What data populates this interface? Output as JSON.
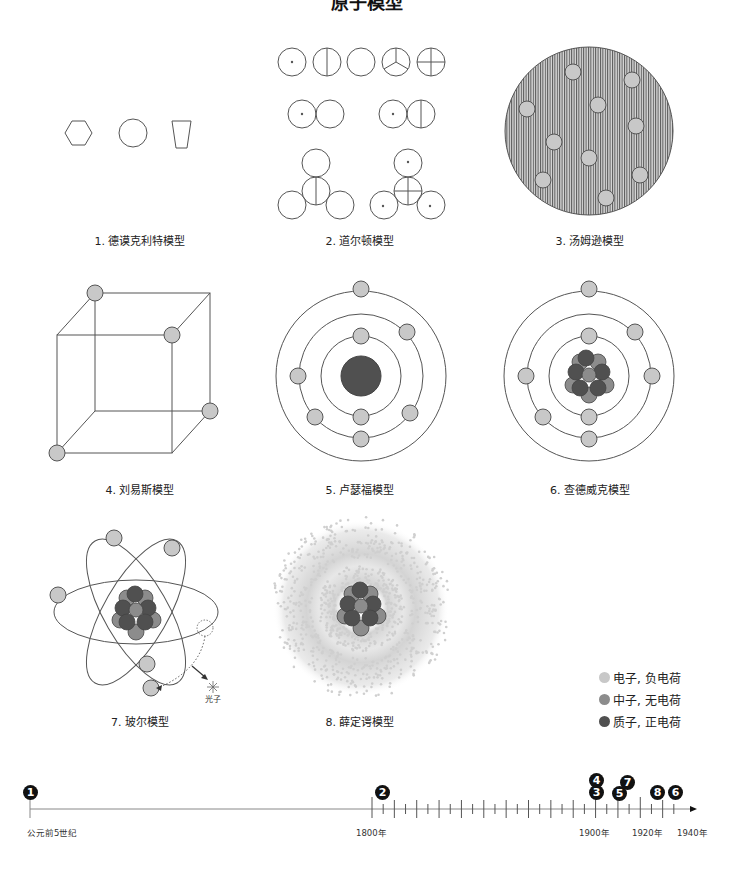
{
  "title": "原子模型",
  "colors": {
    "electron": "#c8c8c8",
    "neutron": "#8c8c8c",
    "proton": "#505050",
    "stroke": "#555555",
    "badge": "#111111"
  },
  "models": [
    {
      "index": 1,
      "caption": "1. 德谟克利特模型",
      "year": "公元前5世纪"
    },
    {
      "index": 2,
      "caption": "2. 道尔顿模型",
      "year": "1803"
    },
    {
      "index": 3,
      "caption": "3. 汤姆逊模型",
      "year": "1904"
    },
    {
      "index": 4,
      "caption": "4. 刘易斯模型",
      "year": "1902"
    },
    {
      "index": 5,
      "caption": "5. 卢瑟福模型",
      "year": "1911"
    },
    {
      "index": 6,
      "caption": "6. 查德威克模型",
      "year": "1932"
    },
    {
      "index": 7,
      "caption": "7. 玻尔模型",
      "year": "1913"
    },
    {
      "index": 8,
      "caption": "8. 薛定谔模型",
      "year": "1926"
    }
  ],
  "bohr": {
    "photon_label": "光子"
  },
  "legend": [
    {
      "label": "电子, 负电荷",
      "color": "#c8c8c8"
    },
    {
      "label": "中子, 无电荷",
      "color": "#8c8c8c"
    },
    {
      "label": "质子, 正电荷",
      "color": "#505050"
    }
  ],
  "timeline": {
    "labels": [
      "公元前5世纪",
      "1800年",
      "1900年",
      "1920年",
      "1940年"
    ],
    "badges": [
      "1",
      "2",
      "3",
      "4",
      "5",
      "7",
      "8",
      "6"
    ]
  }
}
